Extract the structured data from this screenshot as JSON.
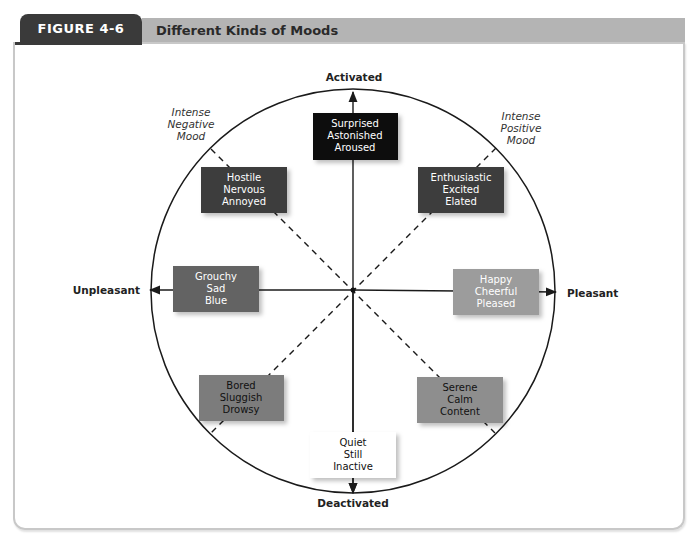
{
  "figure": {
    "number_label": "FIGURE 4-6",
    "title": "Different Kinds of Moods"
  },
  "colors": {
    "tab_dark": "#3a3a3a",
    "title_bar": "#b4b4b4",
    "frame_border": "#c8c8c8",
    "line": "#1a1a1a"
  },
  "axes": {
    "top": "Activated",
    "bottom": "Deactivated",
    "left": "Unpleasant",
    "right": "Pleasant"
  },
  "diagonal_labels": {
    "upper_left": [
      "Intense",
      "Negative",
      "Mood"
    ],
    "upper_right": [
      "Intense",
      "Positive",
      "Mood"
    ]
  },
  "mood_boxes": [
    {
      "id": "surprised",
      "lines": [
        "Surprised",
        "Astonished",
        "Aroused"
      ],
      "fill": "#111111",
      "text": "#ffffff"
    },
    {
      "id": "hostile",
      "lines": [
        "Hostile",
        "Nervous",
        "Annoyed"
      ],
      "fill": "#3d3d3d",
      "text": "#ffffff"
    },
    {
      "id": "enthusiastic",
      "lines": [
        "Enthusiastic",
        "Excited",
        "Elated"
      ],
      "fill": "#3d3d3d",
      "text": "#ffffff"
    },
    {
      "id": "grouchy",
      "lines": [
        "Grouchy",
        "Sad",
        "Blue"
      ],
      "fill": "#646464",
      "text": "#ffffff"
    },
    {
      "id": "happy",
      "lines": [
        "Happy",
        "Cheerful",
        "Pleased"
      ],
      "fill": "#9c9c9c",
      "text": "#ffffff"
    },
    {
      "id": "bored",
      "lines": [
        "Bored",
        "Sluggish",
        "Drowsy"
      ],
      "fill": "#7c7c7c",
      "text": "#111111"
    },
    {
      "id": "serene",
      "lines": [
        "Serene",
        "Calm",
        "Content"
      ],
      "fill": "#8e8e8e",
      "text": "#111111"
    },
    {
      "id": "quiet",
      "lines": [
        "Quiet",
        "Still",
        "Inactive"
      ],
      "fill": "#ffffff",
      "text": "#111111"
    }
  ]
}
